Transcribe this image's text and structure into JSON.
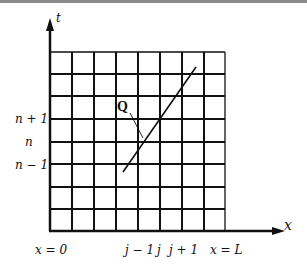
{
  "diagram": {
    "axes": {
      "x_label": "x",
      "t_label": "t"
    },
    "grid": {
      "columns": 8,
      "rows": 8
    },
    "x_tick_labels": {
      "left": "x = 0",
      "j_minus_1": "j − 1",
      "j": "j",
      "j_plus_1": "j + 1",
      "right": "x = L"
    },
    "t_tick_labels": {
      "n_plus_1": "n + 1",
      "n": "n",
      "n_minus_1": "n − 1"
    },
    "point_label": "Q",
    "colors": {
      "line": "#111111",
      "background": "#ffffff"
    }
  }
}
